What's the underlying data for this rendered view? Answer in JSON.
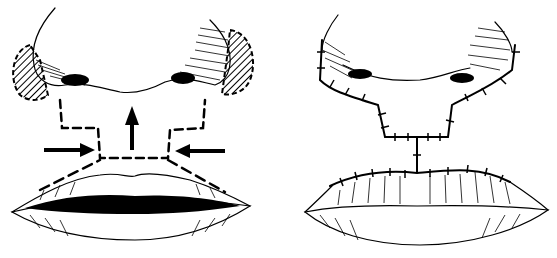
{
  "figure": {
    "panels": [
      {
        "id": "left",
        "label": "",
        "content": "Nose and lips with dashed incision lines outlining the excision area under the nose, hatched alar regions, two horizontal arrows pointing inward and one vertical arrow pointing upward"
      },
      {
        "id": "right",
        "label": "",
        "content": "Postoperative result showing sutured closure lines under the nose and along the upper lip vermilion border"
      }
    ],
    "colors": {
      "ink": "#000000",
      "background": "#ffffff"
    }
  }
}
